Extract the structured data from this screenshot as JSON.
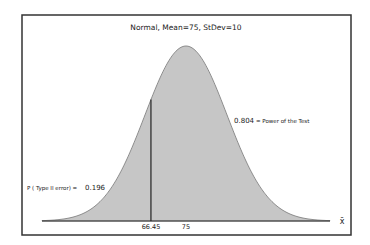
{
  "chart_data": {
    "type": "area",
    "title": "Normal, Mean=75, StDev=10",
    "distribution": "normal",
    "mean": 75,
    "stdev": 10,
    "critical_value": 66.45,
    "xlabel": "x̄",
    "ylabel": "",
    "x_ticks": [
      "66.45",
      "75"
    ],
    "xlim": [
      40,
      110
    ],
    "grid": false,
    "legend": "none",
    "annotations": [
      {
        "text": "P ( Type II error) =  0.196",
        "value": 0.196,
        "region": "left of 66.45"
      },
      {
        "text": "0.804  = Power of the Test",
        "value": 0.804,
        "region": "right of 66.45"
      }
    ],
    "fill_color": "#c6c6c6"
  },
  "labels": {
    "title": "Normal, Mean=75, StDev=10",
    "type2_label": "P ( Type II error) =",
    "type2_value": "0.196",
    "power_value": "0.804",
    "power_label": "= Power of the Test",
    "tick_critical": "66.45",
    "tick_mean": "75",
    "axis_symbol": "x̄"
  }
}
